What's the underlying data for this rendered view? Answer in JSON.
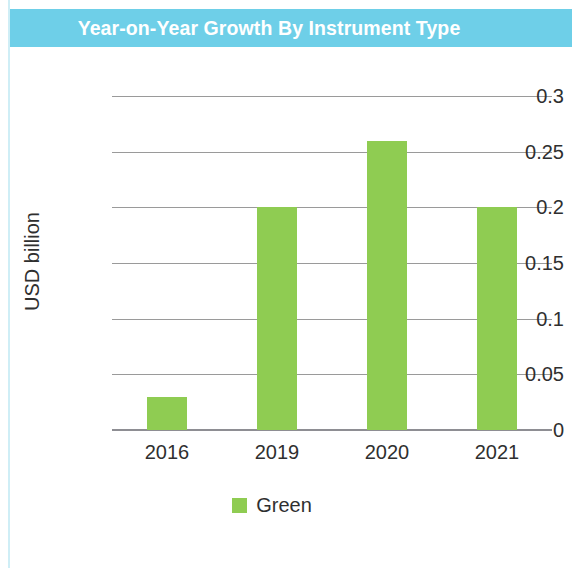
{
  "banner": {
    "title": "Year-on-Year Growth By Instrument Type",
    "background_color": "#6ecfe8",
    "text_color": "#ffffff"
  },
  "chart_data": {
    "type": "bar",
    "title": "Year-on-Year Growth By Instrument Type",
    "xlabel": "",
    "ylabel": "USD billion",
    "categories": [
      "2016",
      "2019",
      "2020",
      "2021"
    ],
    "series": [
      {
        "name": "Green",
        "color": "#8fcc52",
        "values": [
          0.03,
          0.2,
          0.26,
          0.2
        ]
      }
    ],
    "ylim": [
      0,
      0.3
    ],
    "ytick_labels": [
      "0.3",
      "0.25",
      "0.2",
      "0.15",
      "0.1",
      "0.05",
      "0"
    ],
    "ytick_values": [
      0.3,
      0.25,
      0.2,
      0.15,
      0.1,
      0.05,
      0
    ],
    "grid": true,
    "legend_position": "bottom"
  },
  "legend": {
    "entries": [
      {
        "label": "Green",
        "color": "#8fcc52"
      }
    ]
  }
}
